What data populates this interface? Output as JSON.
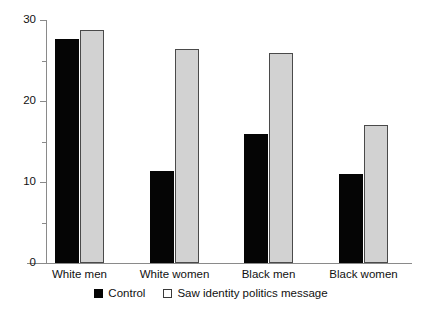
{
  "chart_data": {
    "type": "bar",
    "title": "",
    "subtitle": "",
    "xlabel": "",
    "ylabel": "",
    "categories": [
      "White men",
      "White women",
      "Black men",
      "Black women"
    ],
    "series": [
      {
        "name": "Control",
        "color": "#050505",
        "values": [
          27.6,
          11.4,
          15.9,
          11.0
        ]
      },
      {
        "name": "Saw identity politics message",
        "color": "#d2d2d2",
        "values": [
          28.8,
          26.4,
          25.9,
          17.0
        ]
      }
    ],
    "ylim": [
      0,
      30
    ],
    "yticks": [
      0,
      10,
      20,
      30
    ],
    "ytick_labels": [
      "0",
      "10",
      "20",
      "30"
    ],
    "yticks_minor": [
      5,
      15,
      25
    ],
    "grid": false,
    "legend_position": "bottom"
  },
  "axis": {
    "y_labels": [
      "30",
      "20",
      "10",
      "0"
    ]
  },
  "legend": {
    "entries": [
      {
        "label": "Control",
        "swatch": "black-square-icon"
      },
      {
        "label": "Saw identity politics message",
        "swatch": "white-square-icon"
      }
    ]
  }
}
